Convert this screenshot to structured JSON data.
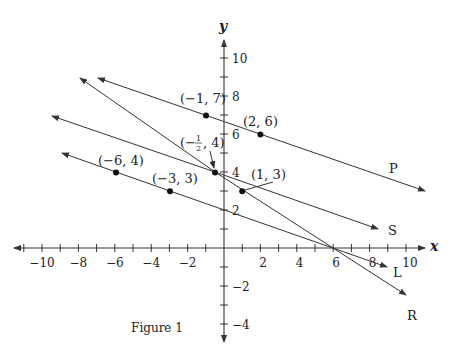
{
  "figure": {
    "caption": "Figure 1",
    "axes": {
      "x_label": "x",
      "y_label": "y",
      "x_ticks": [
        "−10",
        "−8",
        "−6",
        "−4",
        "−2",
        "2",
        "4",
        "6",
        "8",
        "10"
      ],
      "y_ticks": [
        "10",
        "8",
        "6",
        "4",
        "2",
        "−2",
        "−4"
      ]
    },
    "points": [
      {
        "label": "(−1, 7)",
        "x": -1,
        "y": 7
      },
      {
        "label": "(2, 6)",
        "x": 2,
        "y": 6
      },
      {
        "label_prefix": "(−",
        "label_num": "1",
        "label_den": "2",
        "label_suffix": ", 4)",
        "x": -0.5,
        "y": 4
      },
      {
        "label": "(1, 3)",
        "x": 1,
        "y": 3
      },
      {
        "label": "(−6, 4)",
        "x": -6,
        "y": 4
      },
      {
        "label": "(−3, 3)",
        "x": -3,
        "y": 3
      }
    ],
    "lines": [
      {
        "name": "P"
      },
      {
        "name": "S"
      },
      {
        "name": "L"
      },
      {
        "name": "R"
      }
    ],
    "colors": {
      "stroke": "#333333",
      "text": "#222222",
      "background": "#ffffff"
    }
  }
}
